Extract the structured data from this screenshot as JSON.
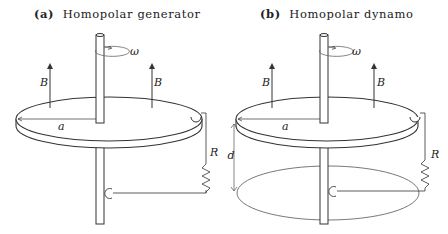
{
  "panels": [
    {
      "id": "a",
      "tag": "(a)",
      "title": "Homopolar generator",
      "labels": {
        "omega": "ω",
        "field_left": "B",
        "field_right": "B",
        "radius": "a",
        "resistor": "R"
      }
    },
    {
      "id": "b",
      "tag": "(b)",
      "title": "Homopolar dynamo",
      "labels": {
        "omega": "ω",
        "field_left": "B",
        "field_right": "B",
        "radius": "a",
        "resistor": "R",
        "separation": "d"
      }
    }
  ],
  "colors": {
    "stroke": "#333333",
    "light_stroke": "#777777",
    "background": "#ffffff"
  }
}
